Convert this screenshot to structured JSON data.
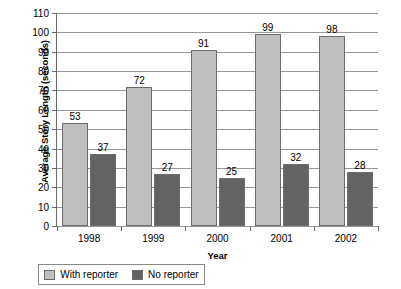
{
  "chart_data": {
    "type": "bar",
    "title": "",
    "subtitle": "",
    "xlabel": "Year",
    "ylabel": "Average Story Length (seconds)",
    "categories": [
      "1998",
      "1999",
      "2000",
      "2001",
      "2002"
    ],
    "series": [
      {
        "name": "With reporter",
        "color": "#BFBFBF",
        "values": [
          53,
          72,
          91,
          99,
          98
        ]
      },
      {
        "name": "No reporter",
        "color": "#636363",
        "values": [
          37,
          27,
          25,
          32,
          28
        ]
      }
    ],
    "ylim": [
      0,
      110
    ],
    "ytick_step": 10,
    "yticks": [
      0,
      10,
      20,
      30,
      40,
      50,
      60,
      70,
      80,
      90,
      100,
      110
    ],
    "grid": "horizontal",
    "data_labels": true,
    "legend_position": "bottom",
    "bar_border_color": "#6D6D6D",
    "gridline_color": "#959595",
    "axis_color": "#6B6B6B",
    "background": "#FFFFFF"
  }
}
